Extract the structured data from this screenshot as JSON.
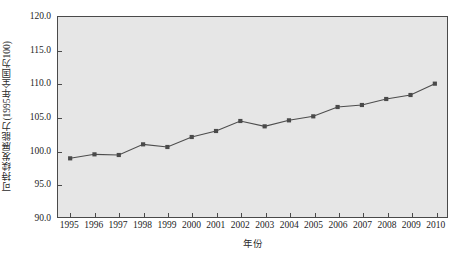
{
  "chart_data": {
    "type": "line",
    "title": "",
    "subtitle": "",
    "xlabel": "年份",
    "ylabel": "可持续发展能力(1995年全国为100)",
    "categories": [
      "1995",
      "1996",
      "1997",
      "1998",
      "1999",
      "2000",
      "2001",
      "2002",
      "2003",
      "2004",
      "2005",
      "2006",
      "2007",
      "2008",
      "2009",
      "2010"
    ],
    "x": [
      1995,
      1996,
      1997,
      1998,
      1999,
      2000,
      2001,
      2002,
      2003,
      2004,
      2005,
      2006,
      2007,
      2008,
      2009,
      2010
    ],
    "values": [
      98.8,
      99.4,
      99.3,
      100.9,
      100.5,
      102.0,
      102.9,
      104.4,
      103.6,
      104.5,
      105.1,
      106.5,
      106.8,
      107.7,
      108.3,
      110.0
    ],
    "series": [
      {
        "name": "可持续发展能力",
        "values": [
          98.8,
          99.4,
          99.3,
          100.9,
          100.5,
          102.0,
          102.9,
          104.4,
          103.6,
          104.5,
          105.1,
          106.5,
          106.8,
          107.7,
          108.3,
          110.0
        ]
      }
    ],
    "ylim": [
      90.0,
      120.0
    ],
    "yticks": [
      90.0,
      95.0,
      100.0,
      105.0,
      110.0,
      115.0,
      120.0
    ],
    "ytick_labels": [
      "90.0",
      "95.0",
      "100.0",
      "105.0",
      "110.0",
      "115.0",
      "120.0"
    ],
    "xlim": [
      1994.5,
      2010.5
    ],
    "grid": false,
    "legend": false,
    "legend_position": "none",
    "marker": "square",
    "line_color": "#4d4d4d",
    "marker_color": "#4a4a4a",
    "plot_background": "#e6e6e6",
    "frame_color": "#4a4a4a",
    "figure_background": "#ffffff"
  }
}
